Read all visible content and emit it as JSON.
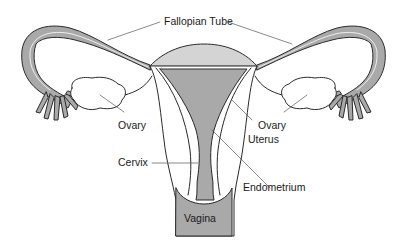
{
  "diagram": {
    "labels": {
      "fallopian_tube": "Fallopian Tube",
      "ovary_left": "Ovary",
      "ovary_right": "Ovary",
      "uterus": "Uterus",
      "cervix": "Cervix",
      "endometrium": "Endometrium",
      "vagina": "Vagina"
    },
    "colors": {
      "tissue_gray": "#a9a9a9",
      "fundus_light": "#d4d4d4",
      "outline": "#2a2a2a",
      "background": "#ffffff"
    }
  }
}
